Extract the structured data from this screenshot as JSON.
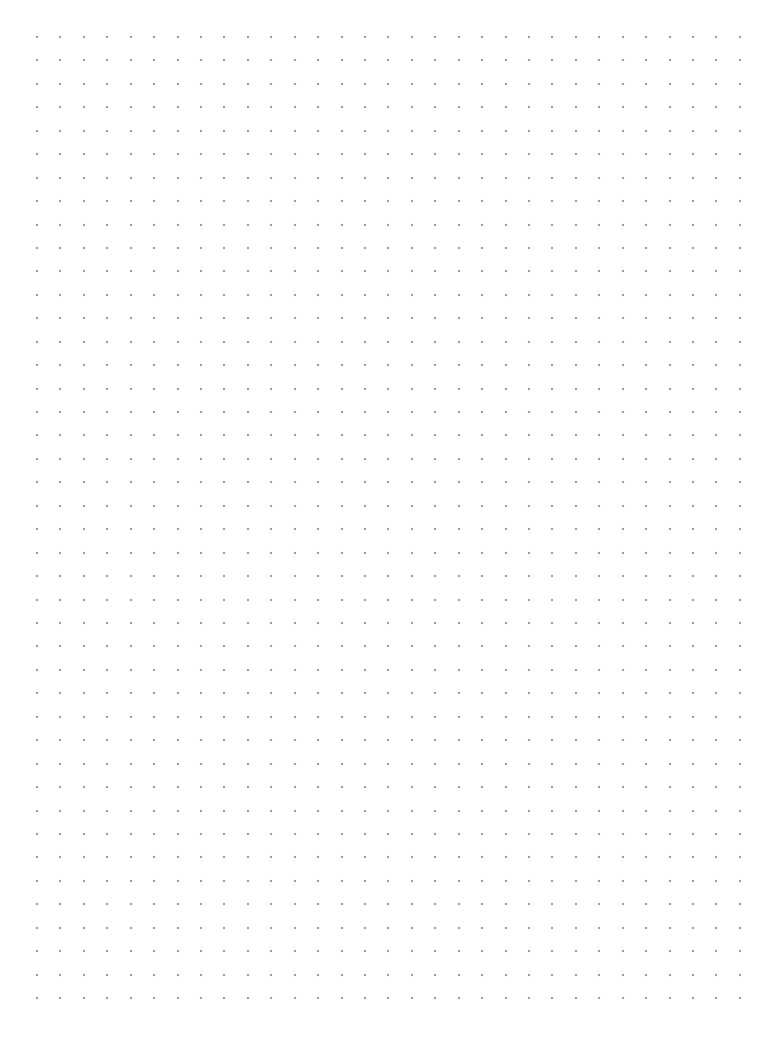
{
  "page": {
    "width": 757,
    "height": 1059,
    "background": "#ffffff"
  },
  "dot_grid": {
    "columns": 31,
    "rows": 42,
    "origin_x": 37,
    "origin_y": 37,
    "pitch_x": 23.43,
    "pitch_y": 23.44,
    "dot_size": 2,
    "dot_color": "#8a8a8a"
  }
}
